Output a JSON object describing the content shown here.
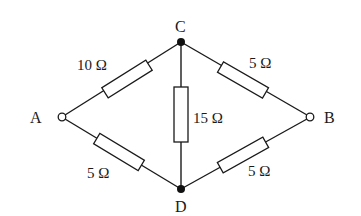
{
  "diagram": {
    "type": "circuit",
    "nodes": [
      {
        "id": "A",
        "label": "A",
        "kind": "terminal"
      },
      {
        "id": "B",
        "label": "B",
        "kind": "terminal"
      },
      {
        "id": "C",
        "label": "C",
        "kind": "junction"
      },
      {
        "id": "D",
        "label": "D",
        "kind": "junction"
      }
    ],
    "resistors": [
      {
        "from": "A",
        "to": "C",
        "label": "10 Ω",
        "value_ohms": 10
      },
      {
        "from": "C",
        "to": "B",
        "label": "5 Ω",
        "value_ohms": 5
      },
      {
        "from": "C",
        "to": "D",
        "label": "15 Ω",
        "value_ohms": 15
      },
      {
        "from": "A",
        "to": "D",
        "label": "5 Ω",
        "value_ohms": 5
      },
      {
        "from": "D",
        "to": "B",
        "label": "5 Ω",
        "value_ohms": 5
      }
    ]
  }
}
